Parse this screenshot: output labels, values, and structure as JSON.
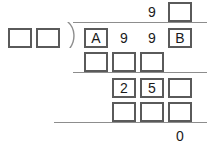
{
  "puzzle": {
    "type": "long-division-puzzle",
    "description": "Long division worked-out problem with blank boxes to fill in",
    "divisor": {
      "digits": [
        {
          "value": "",
          "boxed": true
        },
        {
          "value": "",
          "boxed": true
        }
      ]
    },
    "quotient": {
      "digits": [
        {
          "value": "",
          "boxed": false,
          "column": 1
        },
        {
          "value": "",
          "boxed": false,
          "column": 2
        },
        {
          "value": "9",
          "boxed": false,
          "column": 3
        },
        {
          "value": "",
          "boxed": true,
          "column": 4
        }
      ]
    },
    "dividend": {
      "digits": [
        {
          "value": "A",
          "boxed": true,
          "column": 1
        },
        {
          "value": "9",
          "boxed": false,
          "column": 2
        },
        {
          "value": "9",
          "boxed": false,
          "column": 3
        },
        {
          "value": "B",
          "boxed": true,
          "column": 4
        }
      ]
    },
    "work_rows": [
      {
        "name": "first-subtraction",
        "digits": [
          {
            "value": "",
            "boxed": true,
            "column": 1
          },
          {
            "value": "",
            "boxed": true,
            "column": 2
          },
          {
            "value": "",
            "boxed": true,
            "column": 3
          }
        ]
      },
      {
        "name": "first-remainder",
        "digits": [
          {
            "value": "2",
            "boxed": true,
            "column": 2
          },
          {
            "value": "5",
            "boxed": true,
            "column": 3
          },
          {
            "value": "",
            "boxed": true,
            "column": 4
          }
        ]
      },
      {
        "name": "second-subtraction",
        "digits": [
          {
            "value": "",
            "boxed": true,
            "column": 2
          },
          {
            "value": "",
            "boxed": true,
            "column": 3
          },
          {
            "value": "",
            "boxed": true,
            "column": 4
          }
        ]
      }
    ],
    "remainder": {
      "value": "0",
      "boxed": false,
      "column": 4
    },
    "colors": {
      "box_border": "#5a5a5a",
      "rule": "#8d8d8d",
      "text": "#1a1a1a",
      "background": "#ffffff"
    }
  }
}
